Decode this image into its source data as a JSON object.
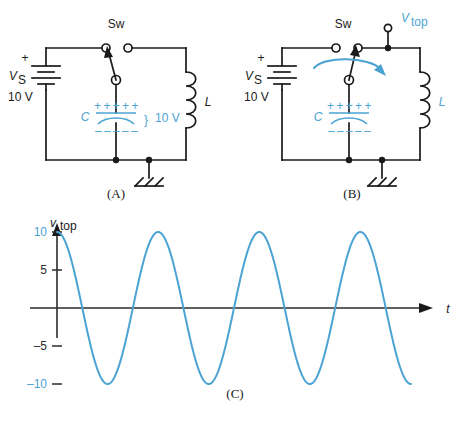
{
  "figure": {
    "accent_color": "#4ba3d3",
    "ink_color": "#1a1a1a"
  },
  "panel_a": {
    "caption": "(A)",
    "switch_label": "Sw",
    "source_label": "V",
    "source_sub": "S",
    "source_sign": "+",
    "source_value": "10 V",
    "cap_label": "C",
    "cap_plus_row": "+ + + + +",
    "cap_minus_row": "– – – – –",
    "cap_brace": "}",
    "cap_voltage": "10 V",
    "inductor_label": "L",
    "ground_icon": "chassis-ground-icon"
  },
  "panel_b": {
    "caption": "(B)",
    "switch_label": "Sw",
    "source_label": "V",
    "source_sub": "S",
    "source_sign": "+",
    "source_value": "10 V",
    "cap_label": "C",
    "cap_plus_row": "+ + + + +",
    "cap_minus_row": "– – – – –",
    "inductor_label": "L",
    "vtop_label": "V",
    "vtop_sub": "top",
    "ground_icon": "chassis-ground-icon",
    "motion_arrow_icon": "curved-arrow-icon"
  },
  "panel_c": {
    "caption": "(C)"
  },
  "chart_data": {
    "type": "line",
    "title": "",
    "ylabel": "v_top",
    "ylabel_main": "v",
    "ylabel_sub": "top",
    "xlabel": "t",
    "ytick_labels": [
      "10",
      "5",
      "–5",
      "–10"
    ],
    "ytick_values": [
      10,
      5,
      -5,
      -10
    ],
    "ytick_colors": [
      "#4ba3d3",
      "#2b2b2b",
      "#2b2b2b",
      "#4ba3d3"
    ],
    "ylim": [
      -11.5,
      11.5
    ],
    "grid": false,
    "legend": false,
    "x_axis_arrow": true,
    "y_axis_arrow": true,
    "series": [
      {
        "name": "v_top",
        "waveform": "cosine",
        "amplitude": 10,
        "cycles": 3.5,
        "phase_deg": 0,
        "x": [
          0.0,
          0.05,
          0.1,
          0.15,
          0.2,
          0.25,
          0.3,
          0.35,
          0.4,
          0.45,
          0.5,
          0.55,
          0.6,
          0.65,
          0.7,
          0.75,
          0.8,
          0.85,
          0.9,
          0.95,
          1.0,
          1.05,
          1.1,
          1.15,
          1.2,
          1.25,
          1.3,
          1.35,
          1.4,
          1.45,
          1.5,
          1.55,
          1.6,
          1.65,
          1.7,
          1.75,
          1.8,
          1.85,
          1.9,
          1.95,
          2.0,
          2.05,
          2.1,
          2.15,
          2.2,
          2.25,
          2.3,
          2.35,
          2.4,
          2.45,
          2.5,
          2.55,
          2.6,
          2.65,
          2.7,
          2.75,
          2.8,
          2.85,
          2.9,
          2.95,
          3.0,
          3.05,
          3.1,
          3.15,
          3.2,
          3.25,
          3.3,
          3.35,
          3.4,
          3.45,
          3.5
        ],
        "y": [
          10.0,
          9.51,
          8.09,
          5.88,
          3.09,
          0.0,
          -3.09,
          -5.88,
          -8.09,
          -9.51,
          -10.0,
          -9.51,
          -8.09,
          -5.88,
          -3.09,
          0.0,
          3.09,
          5.88,
          8.09,
          9.51,
          10.0,
          9.51,
          8.09,
          5.88,
          3.09,
          0.0,
          -3.09,
          -5.88,
          -8.09,
          -9.51,
          -10.0,
          -9.51,
          -8.09,
          -5.88,
          -3.09,
          0.0,
          3.09,
          5.88,
          8.09,
          9.51,
          10.0,
          9.51,
          8.09,
          5.88,
          3.09,
          0.0,
          -3.09,
          -5.88,
          -8.09,
          -9.51,
          -10.0,
          -9.51,
          -8.09,
          -5.88,
          -3.09,
          0.0,
          3.09,
          5.88,
          8.09,
          9.51,
          10.0,
          9.51,
          8.09,
          5.88,
          3.09,
          0.0,
          -3.09,
          -5.88,
          -8.09,
          -9.51,
          -10.0
        ]
      }
    ]
  }
}
